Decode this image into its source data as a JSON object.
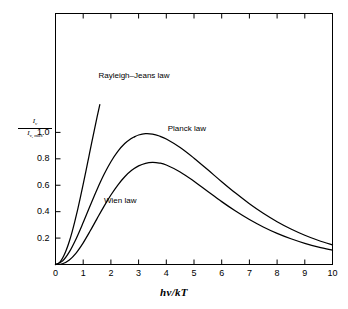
{
  "chart_data": {
    "type": "line",
    "title": "",
    "xlabel": "hv/kT",
    "ylabel_numerator": "I",
    "ylabel_numerator_sub": "v",
    "ylabel_denominator": "I",
    "ylabel_denominator_sub": "v, max",
    "xlim": [
      0,
      10
    ],
    "ylim": [
      0,
      1.9
    ],
    "xticks": [
      0,
      1,
      2,
      3,
      4,
      5,
      6,
      7,
      8,
      9,
      10
    ],
    "xtick_labels": [
      "0",
      "1",
      "2",
      "3",
      "4",
      "5",
      "6",
      "7",
      "8",
      "9",
      "10"
    ],
    "yticks": [
      0.2,
      0.4,
      0.6,
      0.8,
      1.0
    ],
    "ytick_labels": [
      "0.2",
      "0.4",
      "0.6",
      "0.8",
      "1.0"
    ],
    "grid": false,
    "legend_position": "inline-annotations",
    "line_color": "#000000",
    "frame_color": "#000000",
    "background": "#ffffff",
    "annotations": [
      {
        "text": "Rayleigh–Jeans law",
        "x": 1.55,
        "y": 1.42
      },
      {
        "text": "Planck law",
        "x": 4.05,
        "y": 1.02
      },
      {
        "text": "Wien law",
        "x": 1.75,
        "y": 0.47
      }
    ],
    "series": [
      {
        "name": "Rayleigh-Jeans law",
        "x": [
          0.0,
          0.1,
          0.2,
          0.3,
          0.4,
          0.5,
          0.6,
          0.7,
          0.8,
          0.9,
          1.0,
          1.1,
          1.2,
          1.3,
          1.4,
          1.5,
          1.6
        ],
        "values": [
          0.0,
          0.0075,
          0.0296,
          0.0657,
          0.1148,
          0.1757,
          0.2471,
          0.3276,
          0.4156,
          0.5096,
          0.6079,
          0.7091,
          0.8117,
          0.9143,
          1.0157,
          1.1147,
          1.2105
        ]
      },
      {
        "name": "Planck law",
        "x": [
          0.0,
          0.25,
          0.5,
          0.75,
          1.0,
          1.25,
          1.5,
          1.75,
          2.0,
          2.25,
          2.5,
          2.75,
          2.821,
          3.0,
          3.25,
          3.5,
          3.75,
          4.0,
          4.5,
          5.0,
          5.5,
          6.0,
          6.5,
          7.0,
          7.5,
          8.0,
          8.5,
          9.0,
          9.5,
          10.0
        ],
        "values": [
          0.0,
          0.0257,
          0.0955,
          0.1972,
          0.3177,
          0.4448,
          0.5685,
          0.6812,
          0.7781,
          0.8565,
          0.9157,
          0.9564,
          0.9631,
          0.9801,
          0.9899,
          0.9866,
          0.9725,
          0.9496,
          0.8855,
          0.8049,
          0.7166,
          0.6268,
          0.5404,
          0.4602,
          0.3879,
          0.3241,
          0.2689,
          0.2217,
          0.1818,
          0.1485
        ]
      },
      {
        "name": "Wien law",
        "x": [
          0.0,
          0.25,
          0.5,
          0.75,
          1.0,
          1.25,
          1.5,
          1.75,
          2.0,
          2.25,
          2.5,
          2.75,
          3.0,
          3.25,
          3.5,
          3.75,
          4.0,
          4.5,
          5.0,
          5.5,
          6.0,
          6.5,
          7.0,
          7.5,
          8.0,
          8.5,
          9.0,
          9.5,
          10.0
        ],
        "values": [
          0.0,
          0.0056,
          0.0345,
          0.0888,
          0.1642,
          0.2532,
          0.3475,
          0.4403,
          0.5262,
          0.6016,
          0.6642,
          0.7126,
          0.7465,
          0.7663,
          0.7729,
          0.7679,
          0.7529,
          0.7006,
          0.6302,
          0.5527,
          0.476,
          0.4046,
          0.3404,
          0.2843,
          0.2361,
          0.1951,
          0.1606,
          0.1316,
          0.1075
        ]
      }
    ],
    "notes": {
      "peak_planck_y": 1.0,
      "peak_planck_x": 2.82,
      "peak_wien_y": 0.94,
      "peak_wien_x": 3.0,
      "rayleigh_jeans_cutoff_x": 1.6
    }
  }
}
